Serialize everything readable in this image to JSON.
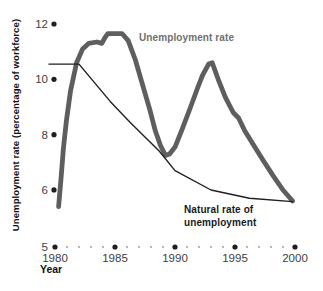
{
  "chart_data": {
    "type": "line",
    "title": "",
    "xlabel": "Year",
    "ylabel": "Unemployment rate (percentage of workforce)",
    "x_range": [
      1980,
      2000
    ],
    "x_ticks": [
      1980,
      1985,
      1990,
      1995,
      2000
    ],
    "x_minor_tick_step": 1,
    "y_ticks": [
      12,
      10,
      8,
      6,
      5
    ],
    "grid": false,
    "legend_position": "inline-annotations",
    "colors": {
      "major_dot": "#1f1f1f",
      "minor_dot": "#b5b5b5",
      "tick_text": "#414141",
      "axis_title_text": "#111111"
    },
    "series": [
      {
        "id": "unemployment-rate",
        "name": "Unemployment rate",
        "label": "Unemployment rate",
        "color": "#5e5e5e",
        "label_color": "#6f6f6f",
        "stroke_width": 4.8,
        "points": [
          [
            1980.3,
            5.4
          ],
          [
            1980.5,
            6.4
          ],
          [
            1980.7,
            7.5
          ],
          [
            1980.95,
            8.5
          ],
          [
            1981.3,
            9.6
          ],
          [
            1981.8,
            10.6
          ],
          [
            1982.3,
            11.1
          ],
          [
            1982.8,
            11.3
          ],
          [
            1983.5,
            11.35
          ],
          [
            1983.9,
            11.3
          ],
          [
            1984.15,
            11.5
          ],
          [
            1984.4,
            11.65
          ],
          [
            1985.6,
            11.65
          ],
          [
            1986.1,
            11.4
          ],
          [
            1986.7,
            10.7
          ],
          [
            1987.3,
            9.8
          ],
          [
            1987.9,
            8.9
          ],
          [
            1988.35,
            8.15
          ],
          [
            1988.8,
            7.6
          ],
          [
            1989.2,
            7.25
          ],
          [
            1989.55,
            7.3
          ],
          [
            1990.0,
            7.55
          ],
          [
            1990.6,
            8.2
          ],
          [
            1991.3,
            9.0
          ],
          [
            1991.85,
            9.65
          ],
          [
            1992.3,
            10.15
          ],
          [
            1992.8,
            10.55
          ],
          [
            1993.1,
            10.6
          ],
          [
            1993.6,
            10.0
          ],
          [
            1994.2,
            9.35
          ],
          [
            1994.85,
            8.8
          ],
          [
            1995.3,
            8.6
          ],
          [
            1995.8,
            8.15
          ],
          [
            1996.3,
            7.8
          ],
          [
            1997.3,
            7.1
          ],
          [
            1998.2,
            6.5
          ],
          [
            1999.0,
            6.0
          ],
          [
            1999.8,
            5.6
          ]
        ]
      },
      {
        "id": "natural-rate",
        "name": "Natural rate of unemployment",
        "label_lines": [
          "Natural rate of",
          "unemployment"
        ],
        "color": "#1f1f1f",
        "label_color": "#1a1a1a",
        "stroke_width": 1.4,
        "points": [
          [
            1979.5,
            10.55
          ],
          [
            1982.0,
            10.55
          ],
          [
            1984.6,
            9.2
          ],
          [
            1986.25,
            8.45
          ],
          [
            1988.7,
            7.4
          ],
          [
            1990.0,
            6.7
          ],
          [
            1993.0,
            6.0
          ],
          [
            1996.2,
            5.7
          ],
          [
            1999.8,
            5.58
          ]
        ]
      }
    ]
  }
}
